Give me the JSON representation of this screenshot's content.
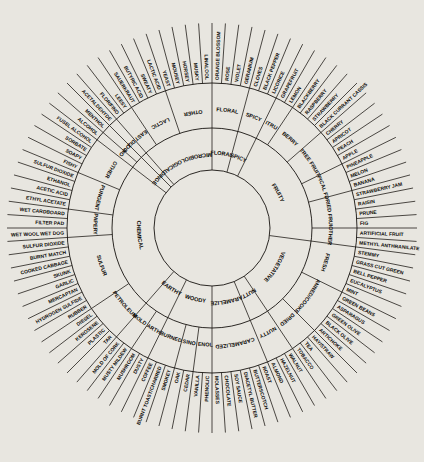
{
  "figure": {
    "name": "wine-aroma-wheel",
    "type": "radial-hierarchy",
    "rings": 3,
    "center": {
      "x": 212,
      "y": 228
    },
    "radii": {
      "inner": 58,
      "mid": 100,
      "outer": 145,
      "label_outer": 205
    },
    "colors": {
      "stroke": "#15120e",
      "paper": "#e8e6e0",
      "sector": "#ece9e3",
      "text": "#0d0b08"
    },
    "start_angle_deg": -90,
    "rotation_note": "tier1 sectors proportional to number of tier3 leaves"
  },
  "page_bleed_text": [
    {
      "text": "be certain you and that is likely to contain all or so, state precisely the",
      "x": 18,
      "y": 10
    },
    {
      "text": "and the table what a style under the circumstances which system of the",
      "x": 18,
      "y": 22
    },
    {
      "text": "to tell you a certain amount of information that asserts the similar",
      "x": 20,
      "y": 34
    },
    {
      "text": "A by certain operations in the wine process of any conclusion which",
      "x": 20,
      "y": 46
    },
    {
      "text": "Personal",
      "x": 22,
      "y": 58
    },
    {
      "text": "Conclusion that any of these",
      "x": 18,
      "y": 76
    },
    {
      "text": "suggestive as attached",
      "x": 18,
      "y": 90
    },
    {
      "text": "sufficient to state of the",
      "x": 18,
      "y": 104
    },
    {
      "text": "continued as and the the of",
      "x": 14,
      "y": 306
    },
    {
      "text": "that is continued in to be",
      "x": 14,
      "y": 322
    },
    {
      "text": "a number of considering a determining that is of this one on the",
      "x": 20,
      "y": 434
    },
    {
      "text": "been the mind of and the terms of the descriptive likely to be",
      "x": 20,
      "y": 448
    }
  ],
  "chart_data": {
    "type": "pie",
    "tier_labels": [
      "category",
      "subcategory",
      "descriptor"
    ],
    "categories": [
      {
        "label": "FLORAL",
        "subcategories": [
          {
            "label": "FLORAL",
            "descriptors": [
              "ORANGE BLOSSOM",
              "ROSE",
              "VIOLET",
              "GERANIUM"
            ]
          }
        ]
      },
      {
        "label": "SPICY",
        "subcategories": [
          {
            "label": "SPICY",
            "descriptors": [
              "CLOVES",
              "BLACK PEPPER",
              "LICORICE"
            ]
          }
        ]
      },
      {
        "label": "FRUITY",
        "subcategories": [
          {
            "label": "CITRUS",
            "descriptors": [
              "GRAPEFRUIT",
              "LEMON"
            ]
          },
          {
            "label": "BERRY",
            "descriptors": [
              "BLACKBERRY",
              "RASPBERRY",
              "STRAWBERRY",
              "BLACK CURRANT CASSIS"
            ]
          },
          {
            "label": "TREE FRUIT",
            "descriptors": [
              "CHERRY",
              "APRICOT",
              "PEACH",
              "APPLE"
            ]
          },
          {
            "label": "TROPICAL FRUIT",
            "descriptors": [
              "PINEAPPLE",
              "MELON",
              "BANANA"
            ]
          },
          {
            "label": "DRIED FRUIT",
            "descriptors": [
              "STRAWBERRY JAM",
              "RAISIN",
              "PRUNE",
              "FIG"
            ]
          },
          {
            "label": "OTHER",
            "descriptors": [
              "ARTIFICIAL FRUIT",
              "METHYL ANTHRANILATE"
            ]
          }
        ]
      },
      {
        "label": "VEGETATIVE",
        "subcategories": [
          {
            "label": "FRESH",
            "descriptors": [
              "STEMMY",
              "GRASS CUT GREEN",
              "BELL PEPPER",
              "EUCALYPTUS",
              "MINT"
            ]
          },
          {
            "label": "CANNED/COOKED",
            "descriptors": [
              "GREEN BEANS",
              "ASPARAGUS",
              "GREEN OLIVE",
              "BLACK OLIVE",
              "ARTICHOKE"
            ]
          },
          {
            "label": "DRIED",
            "descriptors": [
              "HAY/STRAW",
              "TEA",
              "TOBACCO"
            ]
          }
        ]
      },
      {
        "label": "NUTTY",
        "subcategories": [
          {
            "label": "NUTTY",
            "descriptors": [
              "WALNUT",
              "HAZELNUT",
              "ALMOND"
            ]
          }
        ]
      },
      {
        "label": "CARAMELIZED",
        "subcategories": [
          {
            "label": "CARAMELIZED",
            "descriptors": [
              "ROAST",
              "BUTTERSCOTCH",
              "DIACETYL BUTTER",
              "SOY SAUCE",
              "CHOCOLATE",
              "MOLASSES"
            ]
          }
        ]
      },
      {
        "label": "WOODY",
        "subcategories": [
          {
            "label": "PHENOLIC",
            "descriptors": [
              "PHENOLIC",
              "VANILLA"
            ]
          },
          {
            "label": "RESINOUS",
            "descriptors": [
              "CEDAR",
              "OAK"
            ]
          },
          {
            "label": "BURNED",
            "descriptors": [
              "SMOKEY",
              "BURNT TOAST/CHARRED",
              "COFFEE"
            ]
          }
        ]
      },
      {
        "label": "EARTHY",
        "subcategories": [
          {
            "label": "EARTHY",
            "descriptors": [
              "DUSTY",
              "MUSHROOM"
            ]
          },
          {
            "label": "MOLDY",
            "descriptors": [
              "MUSTY MILDEW",
              "MOLD OF CORK"
            ]
          }
        ]
      },
      {
        "label": "CHEMICAL",
        "subcategories": [
          {
            "label": "PETROLEUM",
            "descriptors": [
              "TAR",
              "PLASTIC",
              "KEROSENE",
              "DIESEL"
            ]
          },
          {
            "label": "SULFUR",
            "descriptors": [
              "RUBBER",
              "HYDROGEN SULFIDE",
              "MERCAPTAN",
              "GARLIC",
              "SKUNK",
              "COOKED CABBAGE",
              "BURNT MATCH",
              "SULFUR DIOXIDE"
            ]
          },
          {
            "label": "PAPERY",
            "descriptors": [
              "WET WOOL WET DOG",
              "FILTER PAD",
              "WET CARDBOARD"
            ]
          },
          {
            "label": "PUNGENT",
            "descriptors": [
              "ETHYL ACETATE",
              "ACETIC ACID",
              "ETHANOL",
              "SULFUR DIOXIDE"
            ]
          },
          {
            "label": "OTHER",
            "descriptors": [
              "FISHY",
              "SOAPY",
              "SORBATE",
              "FUSEL ALCOHOL"
            ]
          }
        ]
      },
      {
        "label": "PUNGENT",
        "subcategories": [
          {
            "label": "HOT",
            "descriptors": [
              "ALCOHOL"
            ]
          },
          {
            "label": "COOL",
            "descriptors": [
              "MENTHOL"
            ]
          }
        ]
      },
      {
        "label": "OXIDIZED",
        "subcategories": [
          {
            "label": "OXIDIZED",
            "descriptors": [
              "ACETALDEHYDE"
            ]
          }
        ]
      },
      {
        "label": "MICROBIOLOGICAL",
        "subcategories": [
          {
            "label": "YEASTY",
            "descriptors": [
              "FLOR/FINO",
              "LEESY"
            ]
          },
          {
            "label": "LACTIC",
            "descriptors": [
              "SAUERKRAUT",
              "BUTYRIC ACID",
              "SWEATY",
              "LACTIC ACID"
            ]
          },
          {
            "label": "OTHER",
            "descriptors": [
              "YEAST",
              "MOUSEY",
              "HORSEY",
              "MUSKY",
              "LINALOOL"
            ]
          }
        ]
      }
    ]
  }
}
